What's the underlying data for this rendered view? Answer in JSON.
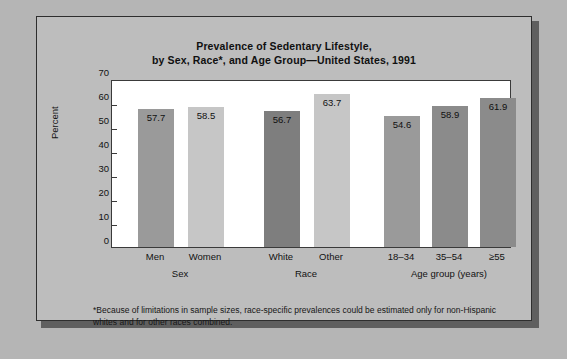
{
  "figure": {
    "title_line1": "Prevalence of Sedentary Lifestyle,",
    "title_line2": "by Sex, Race*, and Age Group—United States, 1991",
    "footnote_line1": "*Because of limitations in sample sizes, race-specific prevalences could be estimated only for non-Hispanic",
    "footnote_line2": "whites and for other races combined.",
    "page_background": "#b5b5b5",
    "panel_background": "#bdbdbd",
    "panel_border": "#2e2e2e",
    "plot_background": "#ffffff"
  },
  "chart_data": {
    "type": "bar",
    "title": "Prevalence of Sedentary Lifestyle, by Sex, Race*, and Age Group—United States, 1991",
    "xlabel": "",
    "ylabel": "Percent",
    "ylim": [
      0,
      70
    ],
    "yticks": [
      0,
      10,
      20,
      30,
      40,
      50,
      60,
      70
    ],
    "grid": false,
    "legend": "none",
    "categories": [
      "Men",
      "Women",
      "White",
      "Other",
      "18–34",
      "35–54",
      "≥55"
    ],
    "values": [
      57.7,
      58.5,
      56.7,
      63.7,
      54.6,
      58.9,
      61.9
    ],
    "value_labels": [
      "57.7",
      "58.5",
      "56.7",
      "63.7",
      "54.6",
      "58.9",
      "61.9"
    ],
    "bar_colors": [
      "#9a9a9a",
      "#c6c6c6",
      "#7e7e7e",
      "#c6c6c6",
      "#9a9a9a",
      "#8b8b8b",
      "#8b8b8b"
    ],
    "groups": [
      {
        "label": "Sex",
        "categories": [
          "Men",
          "Women"
        ]
      },
      {
        "label": "Race",
        "categories": [
          "White",
          "Other"
        ]
      },
      {
        "label": "Age group (years)",
        "categories": [
          "18–34",
          "35–54",
          "≥55"
        ]
      }
    ]
  },
  "y_ticks": [
    {
      "label": "70",
      "value": 70
    },
    {
      "label": "60",
      "value": 60
    },
    {
      "label": "50",
      "value": 50
    },
    {
      "label": "40",
      "value": 40
    },
    {
      "label": "30",
      "value": 30
    },
    {
      "label": "20",
      "value": 20
    },
    {
      "label": "10",
      "value": 10
    },
    {
      "label": "0",
      "value": 0
    }
  ]
}
